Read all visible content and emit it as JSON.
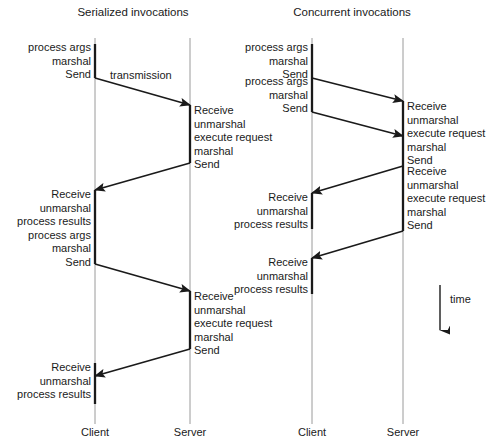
{
  "figure": {
    "background_color": "#ffffff",
    "line_color": "#1a1a1a",
    "lifeline_color": "#8c8c8c",
    "text_color": "#1a1a1a"
  },
  "panels": {
    "left": {
      "title": "Serialized invocations",
      "actors": {
        "client": "Client",
        "server": "Server"
      },
      "transmission_label": "transmission",
      "client_blocks": [
        {
          "id": "client-block-1",
          "lines": "process args\nmarshal\nSend"
        },
        {
          "id": "client-block-2",
          "lines": "Receive\nunmarshal\nprocess results\nprocess args\nmarshal\nSend"
        },
        {
          "id": "client-block-3",
          "lines": "Receive\nunmarshal\nprocess results"
        }
      ],
      "server_blocks": [
        {
          "id": "server-block-1",
          "lines": "Receive\nunmarshal\nexecute request\nmarshal\nSend"
        },
        {
          "id": "server-block-2",
          "lines": "Receive\nunmarshal\nexecute request\nmarshal\nSend"
        }
      ]
    },
    "right": {
      "title": "Concurrent invocations",
      "actors": {
        "client": "Client",
        "server": "Server"
      },
      "client_blocks": [
        {
          "id": "client-block-1",
          "lines": "process args\nmarshal\nSend"
        },
        {
          "id": "client-block-2",
          "lines": "process args\nmarshal\nSend"
        },
        {
          "id": "client-block-3",
          "lines": "Receive\nunmarshal\nprocess results"
        },
        {
          "id": "client-block-4",
          "lines": "Receive\nunmarshal\nprocess results"
        }
      ],
      "server_blocks": [
        {
          "id": "server-block-1",
          "lines": "Receive\nunmarshal\nexecute request\nmarshal\nSend"
        },
        {
          "id": "server-block-2",
          "lines": "Receive\nunmarshal\nexecute request\nmarshal\nSend"
        }
      ]
    }
  },
  "time_axis": {
    "label": "time"
  }
}
